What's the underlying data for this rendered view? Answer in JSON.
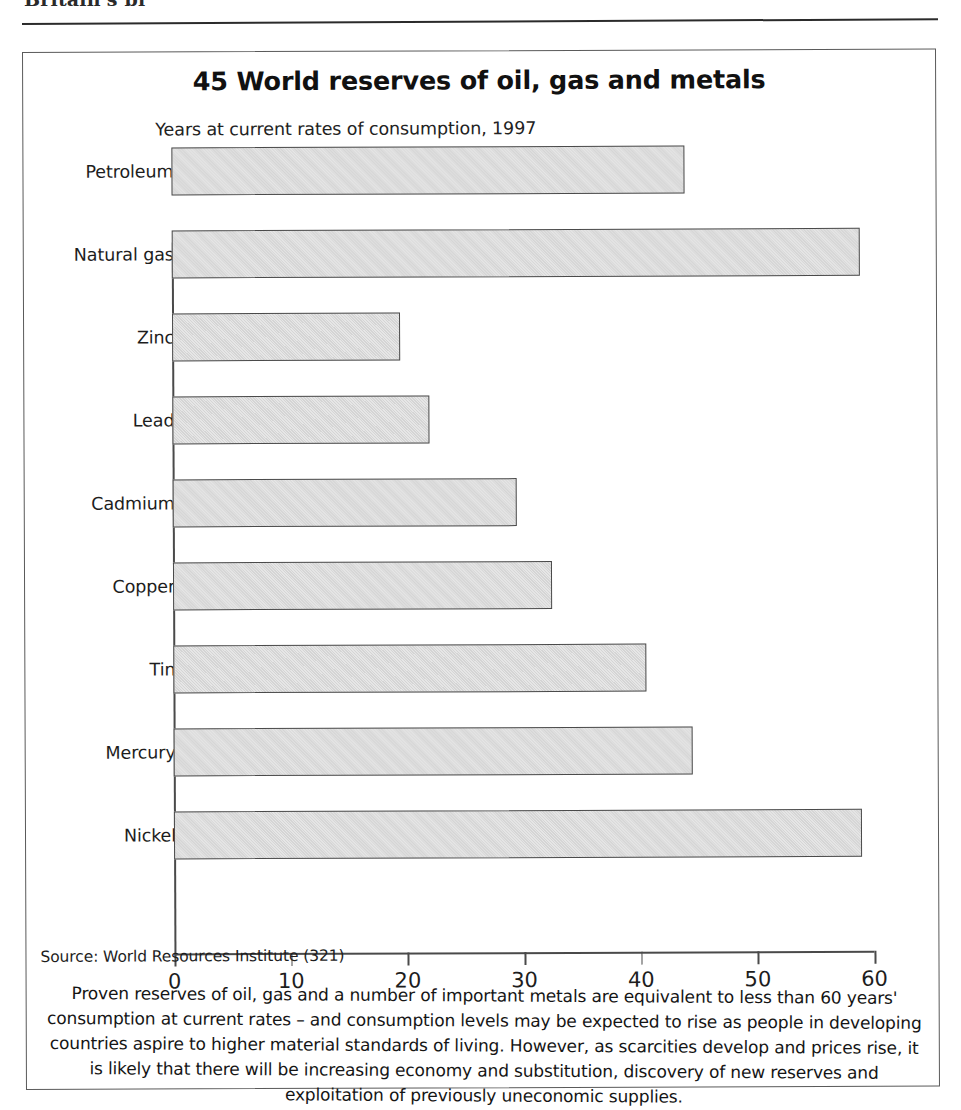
{
  "page": {
    "running_head": "Britain's bl",
    "running_head_note": "cut off at top edge of scan"
  },
  "figure": {
    "number": "45",
    "title": "45 World reserves of oil, gas and metals",
    "subtitle": "Years at current rates of consumption, 1997",
    "source": "Source: World Resources Institute (321)",
    "caption": "Proven reserves of oil, gas and a number of important metals are equivalent to less than 60 years' consumption  at current rates – and consumption levels may be expected to rise as people in developing countries aspire to higher material standards of living. However, as scarcities develop and prices rise, it is likely that there will be increasing economy and substitution, discovery of new reserves and exploitation of previously uneconomic supplies."
  },
  "colors": {
    "bar_fill": "#e6e6e6",
    "bar_stroke": "#4a4a4a",
    "axis": "#4a4a4a",
    "frame": "#5a5a5a",
    "text": "#1a1a1a",
    "page_background": "#ffffff"
  },
  "chart_data": {
    "type": "bar",
    "orientation": "horizontal",
    "title": "45 World reserves of oil, gas and metals",
    "subtitle": "Years at current rates of consumption, 1997",
    "xlabel": "",
    "ylabel": "",
    "xlim": [
      0,
      60
    ],
    "ylim": null,
    "grid": false,
    "legend": null,
    "xticks": [
      0,
      10,
      20,
      30,
      40,
      50,
      60
    ],
    "xtick_labels": [
      "0",
      "10",
      "20",
      "30",
      "40",
      "50",
      "60"
    ],
    "categories": [
      "Petroleum",
      "Natural gas",
      "Zinc",
      "Lead",
      "Cadmium",
      "Copper",
      "Tin",
      "Mercury",
      "Nickel"
    ],
    "values": [
      44,
      59,
      19.5,
      22,
      29.5,
      32.5,
      40.5,
      44.5,
      59
    ],
    "units": "years at current rates of consumption",
    "source": "World Resources Institute (321)"
  }
}
